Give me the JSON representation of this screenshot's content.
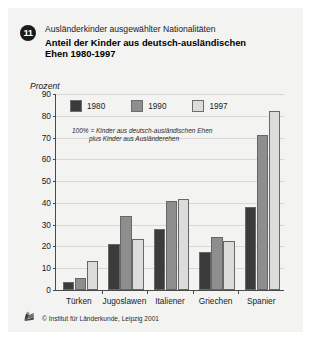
{
  "header": {
    "badge": "11",
    "subtitle": "Ausländerkinder ausgewählter Nationalitäten",
    "title_line1": "Anteil der Kinder aus deutsch-ausländischen",
    "title_line2": "Ehen 1980-1997"
  },
  "footer": {
    "source": "© Institut für Länderkunde, Leipzig 2001",
    "logo_icon": "institute-logo-icon"
  },
  "colors": {
    "background": "#f3f3f2",
    "series_1980": "#3b3b3b",
    "series_1990": "#8e8e8e",
    "series_1997": "#dcdcda",
    "axis": "#4a4a4a",
    "grid": "#d8d8d6"
  },
  "chart_data": {
    "type": "bar",
    "title": "Anteil der Kinder aus deutsch-ausländischen Ehen 1980-1997",
    "subtitle": "Ausländerkinder ausgewählter Nationalitäten",
    "xlabel": "",
    "ylabel": "Prozent",
    "ylim": [
      0,
      90
    ],
    "yticks": [
      0,
      10,
      20,
      30,
      40,
      50,
      60,
      70,
      80,
      90
    ],
    "grid": true,
    "legend_position": "top-left inside plot",
    "annotation_line1": "100% = Kinder aus deutsch-ausländischen Ehen",
    "annotation_line2": "plus Kinder aus Ausländerehen",
    "categories": [
      "Türken",
      "Jugoslawen",
      "Italiener",
      "Griechen",
      "Spanier"
    ],
    "series": [
      {
        "name": "1980",
        "color": "#3b3b3b",
        "values": [
          3.5,
          21,
          28,
          17.5,
          38
        ]
      },
      {
        "name": "1990",
        "color": "#8e8e8e",
        "values": [
          5.5,
          34,
          41,
          24.5,
          71
        ]
      },
      {
        "name": "1997",
        "color": "#dcdcda",
        "values": [
          13.5,
          23.5,
          42,
          22.5,
          82
        ]
      }
    ]
  }
}
